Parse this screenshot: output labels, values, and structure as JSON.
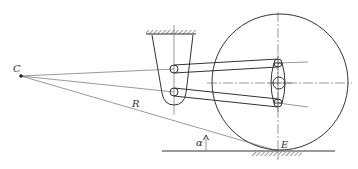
{
  "diagram": {
    "title": "",
    "labels": {
      "instant_center": "C",
      "radius": "R",
      "angle": "α",
      "contact_point": "E"
    },
    "components": [
      "instant-center-point-C",
      "upper-frame-mount-with-ground-hatch",
      "upper-control-arm",
      "lower-control-arm",
      "wheel-carrier-knuckle",
      "wheel-circle",
      "road-ground-line",
      "contact-ground-hatch",
      "radius-line-R",
      "angle-alpha-indicator"
    ],
    "colors": {
      "stroke": "#333333",
      "background": "#ffffff"
    }
  }
}
